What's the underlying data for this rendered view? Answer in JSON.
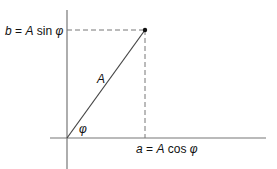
{
  "diagram": {
    "type": "phasor-decomposition",
    "labels": {
      "b_label": {
        "var": "b",
        "eq": " = ",
        "amp": "A",
        "fn": " sin ",
        "angle": "φ"
      },
      "a_label": {
        "var": "a",
        "eq": " = ",
        "amp": "A",
        "fn": " cos ",
        "angle": "φ"
      },
      "vector_label": "A",
      "angle_label": "φ"
    },
    "colors": {
      "axis": "#777777",
      "vector": "#444444",
      "dashed": "#777777",
      "point": "#111111"
    }
  }
}
